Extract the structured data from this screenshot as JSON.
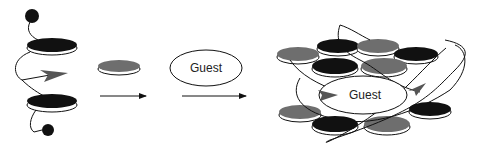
{
  "diagram": {
    "type": "host-guest self-assembly schematic",
    "colors": {
      "black_disc": "#111111",
      "gray_disc": "#6e6e6e",
      "disc_rim": "#ffffff",
      "line": "#1a1a1a",
      "arrow_head": "#555555",
      "background": "#ffffff"
    },
    "stages": [
      {
        "id": "strand",
        "description": "Strand with two black discs, looped linker, internal arrowhead, terminal black beads"
      },
      {
        "id": "gray_disc",
        "description": "Single gray disc component"
      },
      {
        "id": "guest",
        "label": "Guest"
      },
      {
        "id": "assembly",
        "description": "Assembled host of black and gray discs wrapped by strands around central guest",
        "label": "Guest"
      }
    ],
    "arrows": [
      {
        "from": "gray_disc",
        "to": "guest"
      },
      {
        "from": "guest",
        "to": "assembly"
      }
    ]
  }
}
